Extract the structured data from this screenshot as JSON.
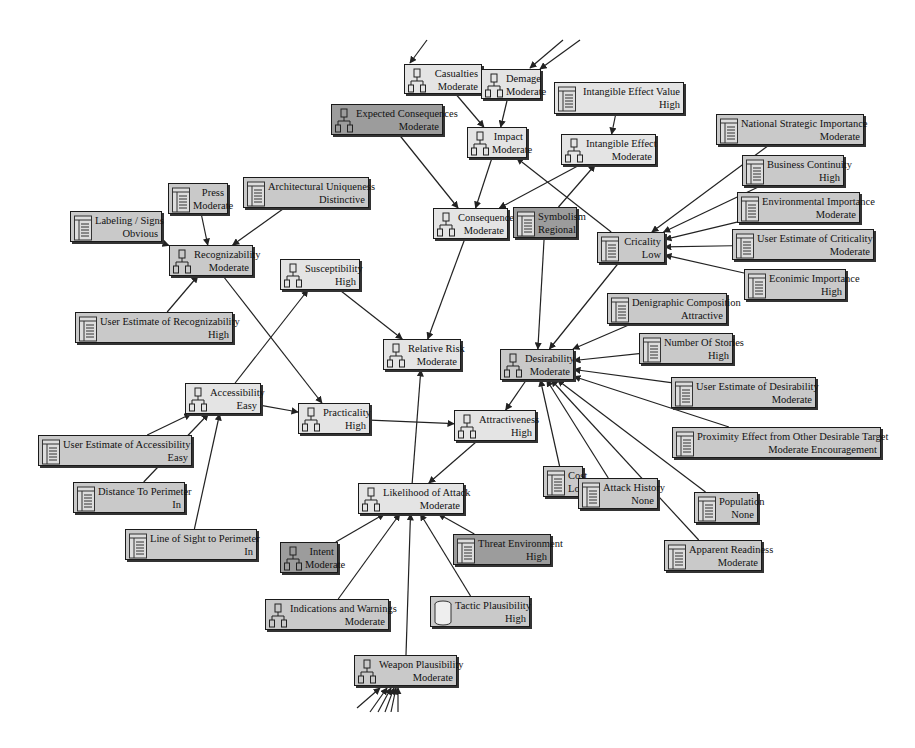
{
  "diagram": {
    "type": "influence network / risk assessment graph",
    "nodes": [
      {
        "id": "casualties",
        "title": "Casualties",
        "value": "Moderate",
        "icon": "hierarchy-icon",
        "x": 404,
        "y": 64,
        "w": 78,
        "h": 30,
        "shade": "light"
      },
      {
        "id": "damage",
        "title": "Demage",
        "value": "Moderate",
        "icon": "hierarchy-icon",
        "x": 481,
        "y": 69,
        "w": 60,
        "h": 30,
        "shade": "light"
      },
      {
        "id": "intangible_value",
        "title": "Intangible Effect Value",
        "value": "High",
        "icon": "table-icon",
        "x": 554,
        "y": 82,
        "w": 130,
        "h": 32,
        "shade": "light"
      },
      {
        "id": "expected_consequences",
        "title": "Expected Consequences",
        "value": "Moderate",
        "icon": "hierarchy-icon",
        "x": 331,
        "y": 104,
        "w": 112,
        "h": 31,
        "shade": "dark"
      },
      {
        "id": "impact",
        "title": "Impact",
        "value": "Moderate",
        "icon": "hierarchy-icon",
        "x": 467,
        "y": 127,
        "w": 60,
        "h": 31,
        "shade": "light"
      },
      {
        "id": "intangible_effect",
        "title": "Intangible Effect",
        "value": "Moderate",
        "icon": "hierarchy-icon",
        "x": 561,
        "y": 134,
        "w": 95,
        "h": 31,
        "shade": "light"
      },
      {
        "id": "national_strategic",
        "title": "National Strategic Importance",
        "value": "Moderate",
        "icon": "table-icon",
        "x": 716,
        "y": 114,
        "w": 148,
        "h": 31,
        "shade": "mid"
      },
      {
        "id": "business_continuity",
        "title": "Business Continuity",
        "value": "High",
        "icon": "table-icon",
        "x": 742,
        "y": 155,
        "w": 102,
        "h": 31,
        "shade": "mid"
      },
      {
        "id": "environmental",
        "title": "Environmental Importance",
        "value": "Moderate",
        "icon": "table-icon",
        "x": 737,
        "y": 192,
        "w": 123,
        "h": 31,
        "shade": "mid"
      },
      {
        "id": "user_criticality",
        "title": "User Estimate of Criticality",
        "value": "Moderate",
        "icon": "table-icon",
        "x": 732,
        "y": 229,
        "w": 142,
        "h": 31,
        "shade": "mid"
      },
      {
        "id": "economic",
        "title": "Econimic Importance",
        "value": "High",
        "icon": "table-icon",
        "x": 744,
        "y": 269,
        "w": 102,
        "h": 31,
        "shade": "mid"
      },
      {
        "id": "press",
        "title": "Press",
        "value": "Moderate",
        "icon": "table-icon",
        "x": 168,
        "y": 183,
        "w": 60,
        "h": 31,
        "shade": "mid"
      },
      {
        "id": "arch_unique",
        "title": "Architectural Uniqueness",
        "value": "Distinctive",
        "icon": "table-icon",
        "x": 243,
        "y": 177,
        "w": 126,
        "h": 31,
        "shade": "mid"
      },
      {
        "id": "labeling",
        "title": "Labeling / Signs",
        "value": "Obvious",
        "icon": "table-icon",
        "x": 70,
        "y": 211,
        "w": 92,
        "h": 31,
        "shade": "mid"
      },
      {
        "id": "consequences",
        "title": "Consequences",
        "value": "Moderate",
        "icon": "hierarchy-icon",
        "x": 433,
        "y": 208,
        "w": 75,
        "h": 31,
        "shade": "light"
      },
      {
        "id": "symbolism",
        "title": "Symbolism",
        "value": "Regional",
        "icon": "table-icon",
        "x": 513,
        "y": 207,
        "w": 64,
        "h": 31,
        "shade": "dark"
      },
      {
        "id": "criticality",
        "title": "Cricality",
        "value": "Low",
        "icon": "table-icon",
        "x": 597,
        "y": 232,
        "w": 68,
        "h": 31,
        "shade": "mid"
      },
      {
        "id": "recognizability",
        "title": "Recognizability",
        "value": "Moderate",
        "icon": "hierarchy-icon",
        "x": 169,
        "y": 245,
        "w": 84,
        "h": 31,
        "shade": "mid"
      },
      {
        "id": "susceptibility",
        "title": "Susceptibility",
        "value": "High",
        "icon": "hierarchy-icon",
        "x": 280,
        "y": 259,
        "w": 80,
        "h": 31,
        "shade": "light"
      },
      {
        "id": "user_recognizability",
        "title": "User Estimate of Recognizability",
        "value": "High",
        "icon": "table-icon",
        "x": 75,
        "y": 312,
        "w": 158,
        "h": 31,
        "shade": "mid"
      },
      {
        "id": "demographic",
        "title": "Denigraphic Composition",
        "value": "Attractive",
        "icon": "table-icon",
        "x": 607,
        "y": 293,
        "w": 120,
        "h": 31,
        "shade": "mid"
      },
      {
        "id": "relative_risk",
        "title": "Relative Risk",
        "value": "Moderate",
        "icon": "hierarchy-icon",
        "x": 383,
        "y": 339,
        "w": 78,
        "h": 31,
        "shade": "light"
      },
      {
        "id": "desirability",
        "title": "Desirability",
        "value": "Moderate",
        "icon": "hierarchy-icon",
        "x": 500,
        "y": 349,
        "w": 74,
        "h": 31,
        "shade": "mid"
      },
      {
        "id": "num_stories",
        "title": "Number Of Stories",
        "value": "High",
        "icon": "table-icon",
        "x": 639,
        "y": 333,
        "w": 94,
        "h": 31,
        "shade": "mid"
      },
      {
        "id": "user_desirability",
        "title": "User Estimate of Desirability",
        "value": "Moderate",
        "icon": "table-icon",
        "x": 671,
        "y": 377,
        "w": 145,
        "h": 31,
        "shade": "mid"
      },
      {
        "id": "accessibility",
        "title": "Accessibility",
        "value": "Easy",
        "icon": "hierarchy-icon",
        "x": 185,
        "y": 383,
        "w": 76,
        "h": 31,
        "shade": "light"
      },
      {
        "id": "practicality",
        "title": "Practicality",
        "value": "High",
        "icon": "hierarchy-icon",
        "x": 298,
        "y": 403,
        "w": 72,
        "h": 31,
        "shade": "light"
      },
      {
        "id": "attractiveness",
        "title": "Attractiveness",
        "value": "High",
        "icon": "hierarchy-icon",
        "x": 454,
        "y": 410,
        "w": 82,
        "h": 31,
        "shade": "light"
      },
      {
        "id": "proximity",
        "title": "Proximity Effect from Other Desirable Target",
        "value": "Moderate Encouragement",
        "icon": "table-icon",
        "x": 672,
        "y": 427,
        "w": 209,
        "h": 31,
        "shade": "mid"
      },
      {
        "id": "user_accessibility",
        "title": "User Estimate of Accessibility",
        "value": "Easy",
        "icon": "table-icon",
        "x": 38,
        "y": 435,
        "w": 154,
        "h": 31,
        "shade": "mid"
      },
      {
        "id": "cost",
        "title": "Cost",
        "value": "Low",
        "icon": "table-icon",
        "x": 543,
        "y": 466,
        "w": 40,
        "h": 31,
        "shade": "mid"
      },
      {
        "id": "distance_perimeter",
        "title": "Distance To Perimeter",
        "value": "In",
        "icon": "table-icon",
        "x": 73,
        "y": 482,
        "w": 112,
        "h": 31,
        "shade": "mid"
      },
      {
        "id": "likelihood",
        "title": "Likelihood of Attack",
        "value": "Moderate",
        "icon": "hierarchy-icon",
        "x": 358,
        "y": 483,
        "w": 106,
        "h": 31,
        "shade": "light"
      },
      {
        "id": "attack_history",
        "title": "Attack History",
        "value": "None",
        "icon": "table-icon",
        "x": 578,
        "y": 478,
        "w": 80,
        "h": 31,
        "shade": "mid"
      },
      {
        "id": "population",
        "title": "Population",
        "value": "None",
        "icon": "table-icon",
        "x": 694,
        "y": 492,
        "w": 64,
        "h": 31,
        "shade": "mid"
      },
      {
        "id": "line_of_sight",
        "title": "Line of Sight to Perimeter",
        "value": "In",
        "icon": "table-icon",
        "x": 125,
        "y": 529,
        "w": 132,
        "h": 31,
        "shade": "mid"
      },
      {
        "id": "intent",
        "title": "Intent",
        "value": "Moderate",
        "icon": "hierarchy-icon",
        "x": 280,
        "y": 542,
        "w": 58,
        "h": 31,
        "shade": "dark"
      },
      {
        "id": "threat_env",
        "title": "Threat Environment",
        "value": "High",
        "icon": "table-icon",
        "x": 453,
        "y": 534,
        "w": 98,
        "h": 31,
        "shade": "dark"
      },
      {
        "id": "apparent_readiness",
        "title": "Apparent Readiness",
        "value": "Moderate",
        "icon": "table-icon",
        "x": 664,
        "y": 540,
        "w": 98,
        "h": 31,
        "shade": "mid"
      },
      {
        "id": "indications",
        "title": "Indications and Warnings",
        "value": "Moderate",
        "icon": "hierarchy-icon",
        "x": 265,
        "y": 599,
        "w": 124,
        "h": 31,
        "shade": "mid"
      },
      {
        "id": "tactic",
        "title": "Tactic Plausibility",
        "value": "High",
        "icon": "cylinder-icon",
        "x": 430,
        "y": 596,
        "w": 100,
        "h": 31,
        "shade": "mid"
      },
      {
        "id": "weapon",
        "title": "Weapon Plausibility",
        "value": "Moderate",
        "icon": "hierarchy-icon",
        "x": 354,
        "y": 655,
        "w": 103,
        "h": 31,
        "shade": "mid"
      }
    ],
    "edges": [
      [
        "casualties",
        "impact"
      ],
      [
        "damage",
        "impact"
      ],
      [
        "intangible_value",
        "intangible_effect"
      ],
      [
        "expected_consequences",
        "consequences"
      ],
      [
        "impact",
        "consequences"
      ],
      [
        "intangible_effect",
        "consequences"
      ],
      [
        "criticality",
        "impact"
      ],
      [
        "symbolism",
        "intangible_effect"
      ],
      [
        "national_strategic",
        "criticality"
      ],
      [
        "business_continuity",
        "criticality"
      ],
      [
        "environmental",
        "criticality"
      ],
      [
        "user_criticality",
        "criticality"
      ],
      [
        "economic",
        "criticality"
      ],
      [
        "press",
        "recognizability"
      ],
      [
        "arch_unique",
        "recognizability"
      ],
      [
        "labeling",
        "recognizability"
      ],
      [
        "user_recognizability",
        "recognizability"
      ],
      [
        "recognizability",
        "practicality"
      ],
      [
        "susceptibility",
        "relative_risk"
      ],
      [
        "accessibility",
        "susceptibility"
      ],
      [
        "consequences",
        "relative_risk"
      ],
      [
        "likelihood",
        "relative_risk"
      ],
      [
        "symbolism",
        "desirability"
      ],
      [
        "criticality",
        "desirability"
      ],
      [
        "demographic",
        "desirability"
      ],
      [
        "num_stories",
        "desirability"
      ],
      [
        "user_desirability",
        "desirability"
      ],
      [
        "proximity",
        "desirability"
      ],
      [
        "cost",
        "desirability"
      ],
      [
        "attack_history",
        "desirability"
      ],
      [
        "population",
        "desirability"
      ],
      [
        "apparent_readiness",
        "desirability"
      ],
      [
        "desirability",
        "attractiveness"
      ],
      [
        "accessibility",
        "practicality"
      ],
      [
        "practicality",
        "attractiveness"
      ],
      [
        "attractiveness",
        "likelihood"
      ],
      [
        "user_accessibility",
        "accessibility"
      ],
      [
        "distance_perimeter",
        "accessibility"
      ],
      [
        "line_of_sight",
        "accessibility"
      ],
      [
        "intent",
        "likelihood"
      ],
      [
        "indications",
        "likelihood"
      ],
      [
        "weapon",
        "likelihood"
      ],
      [
        "tactic",
        "likelihood"
      ],
      [
        "threat_env",
        "likelihood"
      ]
    ],
    "dangling_edges": [
      {
        "x1": 427,
        "y1": 40,
        "x2": 410,
        "y2": 63
      },
      {
        "x1": 563,
        "y1": 40,
        "x2": 530,
        "y2": 68
      },
      {
        "x1": 580,
        "y1": 40,
        "x2": 540,
        "y2": 69
      },
      {
        "x1": 357,
        "y1": 708,
        "x2": 380,
        "y2": 688
      },
      {
        "x1": 370,
        "y1": 712,
        "x2": 387,
        "y2": 688
      },
      {
        "x1": 378,
        "y1": 712,
        "x2": 391,
        "y2": 688
      },
      {
        "x1": 385,
        "y1": 712,
        "x2": 394,
        "y2": 688
      },
      {
        "x1": 391,
        "y1": 712,
        "x2": 396,
        "y2": 688
      },
      {
        "x1": 398,
        "y1": 712,
        "x2": 398,
        "y2": 688
      }
    ]
  }
}
